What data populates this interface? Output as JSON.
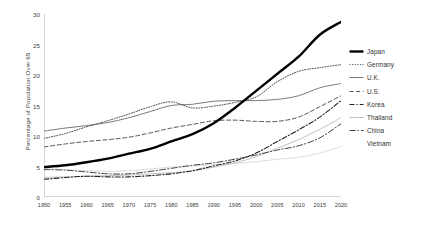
{
  "chart_data": {
    "type": "line",
    "title": "",
    "xlabel": "",
    "ylabel": "Percentage of Population Over 65",
    "xlim": [
      1950,
      2020
    ],
    "ylim": [
      0,
      30
    ],
    "yticks": [
      0,
      5,
      10,
      15,
      20,
      25,
      30
    ],
    "grid": false,
    "legend_position": "right",
    "x": [
      1950,
      1955,
      1960,
      1965,
      1970,
      1975,
      1980,
      1985,
      1990,
      1995,
      2000,
      2005,
      2010,
      2015,
      2020
    ],
    "categories": [
      "1950",
      "1955",
      "1960",
      "1965",
      "1970",
      "1975",
      "1980",
      "1985",
      "1990",
      "1995",
      "2000",
      "2005",
      "2010",
      "2015",
      "2020"
    ],
    "series": [
      {
        "name": "Japan",
        "style": "solid-bold",
        "color": "#000000",
        "width": 2.4,
        "values": [
          4.9,
          5.2,
          5.7,
          6.3,
          7.1,
          7.9,
          9.1,
          10.3,
          12.1,
          14.6,
          17.4,
          20.2,
          23.0,
          26.6,
          28.7
        ]
      },
      {
        "name": "Germany",
        "style": "dotted",
        "color": "#444444",
        "width": 1.0,
        "values": [
          9.6,
          10.4,
          11.5,
          12.5,
          13.6,
          14.8,
          15.6,
          14.6,
          14.9,
          15.5,
          16.4,
          18.9,
          20.6,
          21.2,
          21.7
        ]
      },
      {
        "name": "U.K.",
        "style": "solid-thin",
        "color": "#7a7a7a",
        "width": 1.0,
        "values": [
          10.8,
          11.3,
          11.7,
          12.2,
          13.0,
          14.0,
          15.0,
          15.2,
          15.7,
          15.8,
          15.8,
          16.0,
          16.6,
          17.9,
          18.6
        ]
      },
      {
        "name": "U.S.",
        "style": "dashed",
        "color": "#555555",
        "width": 1.0,
        "values": [
          8.2,
          8.7,
          9.1,
          9.4,
          9.8,
          10.5,
          11.3,
          11.9,
          12.5,
          12.6,
          12.4,
          12.4,
          13.1,
          14.8,
          16.6
        ]
      },
      {
        "name": "Korea",
        "style": "dashdot",
        "color": "#222222",
        "width": 1.1,
        "values": [
          2.9,
          3.2,
          3.4,
          3.3,
          3.3,
          3.5,
          3.8,
          4.3,
          5.1,
          5.9,
          7.2,
          9.1,
          11.0,
          13.1,
          15.8
        ]
      },
      {
        "name": "Thailand",
        "style": "solid-light",
        "color": "#c2c2c2",
        "width": 1.0,
        "values": [
          3.2,
          3.3,
          3.4,
          3.5,
          3.6,
          3.8,
          4.0,
          4.3,
          4.9,
          5.6,
          6.6,
          8.0,
          9.4,
          11.1,
          13.0
        ]
      },
      {
        "name": "China",
        "style": "dashdot-med",
        "color": "#3d3d3d",
        "width": 1.0,
        "values": [
          4.5,
          4.4,
          4.1,
          3.8,
          3.8,
          4.2,
          4.7,
          5.2,
          5.6,
          6.2,
          6.9,
          7.7,
          8.4,
          9.7,
          12.0
        ]
      },
      {
        "name": "Vietnam",
        "style": "solid-faint",
        "color": "#dcdcdc",
        "width": 1.0,
        "values": [
          4.6,
          4.5,
          4.3,
          4.2,
          4.3,
          4.6,
          4.9,
          5.1,
          5.3,
          5.5,
          5.8,
          6.2,
          6.5,
          7.2,
          8.3
        ]
      }
    ]
  },
  "legend": {
    "items": [
      {
        "label": "Japan"
      },
      {
        "label": "Germany"
      },
      {
        "label": "U.K."
      },
      {
        "label": "U.S."
      },
      {
        "label": "Korea"
      },
      {
        "label": "Thailand"
      },
      {
        "label": "China"
      },
      {
        "label": "Vietnam"
      }
    ]
  }
}
